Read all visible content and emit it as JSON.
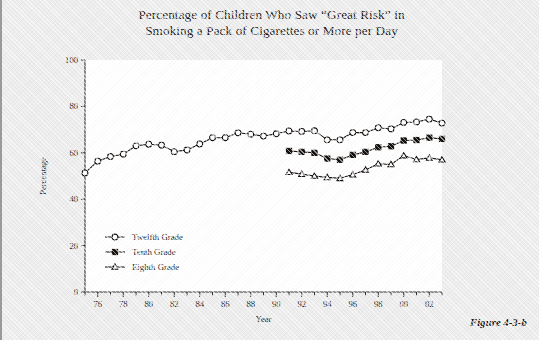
{
  "title": {
    "line1": "Percentage of Children Who Saw “Great Risk” in",
    "line2": "Smoking a Pack of Cigarettes or More per Day"
  },
  "caption": "Figure 4-3-b",
  "colors": {
    "page_background": "#ececec",
    "plot_background": "#ffffff",
    "ink": "#14100e",
    "text": "#1b1b1b"
  },
  "chart_data": {
    "type": "line",
    "title": "Percentage of Children Who Saw “Great Risk” in Smoking a Pack of Cigarettes or More per Day",
    "xlabel": "Year",
    "ylabel": "Percentage",
    "xlim": [
      1975,
      2003
    ],
    "ylim": [
      0,
      100
    ],
    "yticks": [
      0,
      20,
      40,
      60,
      80,
      100
    ],
    "ytick_labels": [
      "0",
      "20",
      "40",
      "60",
      "80",
      "100"
    ],
    "xticks": [
      1976,
      1978,
      1980,
      1982,
      1984,
      1986,
      1988,
      1990,
      1992,
      1994,
      1996,
      1998,
      2000,
      2002
    ],
    "xtick_labels": [
      "76",
      "78",
      "80",
      "82",
      "84",
      "86",
      "88",
      "90",
      "92",
      "94",
      "96",
      "98",
      "00",
      "02"
    ],
    "xtick_minor_step": 1,
    "grid": false,
    "legend_position": "inside-lower-left",
    "series": [
      {
        "name": "Twelfth Grade",
        "marker": "open-circle",
        "x": [
          1975,
          1976,
          1977,
          1978,
          1979,
          1980,
          1981,
          1982,
          1983,
          1984,
          1985,
          1986,
          1987,
          1988,
          1989,
          1990,
          1991,
          1992,
          1993,
          1994,
          1995,
          1996,
          1997,
          1998,
          1999,
          2000,
          2001,
          2002,
          2003
        ],
        "values": [
          51.3,
          56.4,
          58.4,
          59.4,
          63.0,
          63.7,
          63.3,
          60.5,
          61.2,
          63.8,
          66.5,
          66.5,
          68.6,
          68.0,
          67.2,
          68.2,
          69.4,
          69.2,
          69.5,
          65.6,
          65.6,
          68.7,
          68.7,
          70.8,
          70.3,
          73.1,
          73.3,
          74.5,
          72.8
        ]
      },
      {
        "name": "Tenth Grade",
        "marker": "filled-square",
        "x": [
          1991,
          1992,
          1993,
          1994,
          1995,
          1996,
          1997,
          1998,
          1999,
          2000,
          2001,
          2002,
          2003
        ],
        "values": [
          60.8,
          60.4,
          60.0,
          57.5,
          57.0,
          59.1,
          60.4,
          62.4,
          62.8,
          65.3,
          65.5,
          66.5,
          66.0
        ]
      },
      {
        "name": "Eighth Grade",
        "marker": "open-triangle",
        "x": [
          1991,
          1992,
          1993,
          1994,
          1995,
          1996,
          1997,
          1998,
          1999,
          2000,
          2001,
          2002,
          2003
        ],
        "values": [
          51.6,
          50.8,
          50.0,
          49.4,
          49.0,
          50.6,
          52.6,
          55.3,
          55.0,
          58.8,
          57.1,
          57.8,
          57.0
        ]
      }
    ]
  },
  "legend": [
    {
      "label": "Twelfth Grade",
      "marker": "open-circle"
    },
    {
      "label": "Tenth Grade",
      "marker": "filled-square"
    },
    {
      "label": "Eighth Grade",
      "marker": "open-triangle"
    }
  ]
}
